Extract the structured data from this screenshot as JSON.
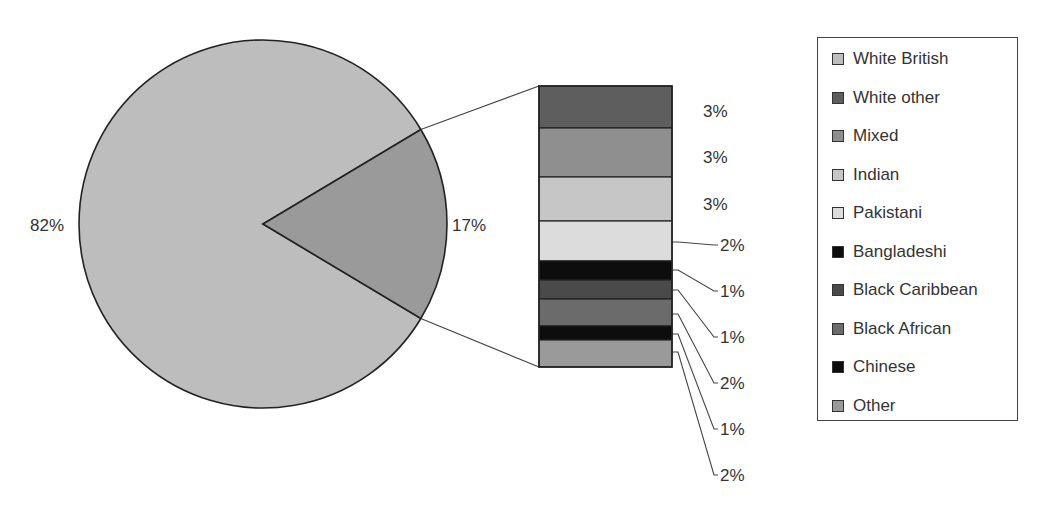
{
  "chart_data": {
    "type": "pie",
    "subtype": "bar-of-pie",
    "title": "",
    "pie": {
      "slices": [
        {
          "name": "White British",
          "value": 82,
          "label": "82%",
          "color": "#bdbdbd"
        },
        {
          "name": "All other ethnic groups",
          "value": 17,
          "label": "17%",
          "color": "#9a9a9a"
        }
      ]
    },
    "bar": {
      "segments": [
        {
          "name": "White other",
          "value": 3,
          "label": "3%",
          "color": "#5e5e5e"
        },
        {
          "name": "Mixed",
          "value": 3,
          "label": "3%",
          "color": "#8f8f8f"
        },
        {
          "name": "Indian",
          "value": 3,
          "label": "3%",
          "color": "#c6c6c6"
        },
        {
          "name": "Pakistani",
          "value": 2,
          "label": "2%",
          "color": "#dcdcdc"
        },
        {
          "name": "Bangladeshi",
          "value": 1,
          "label": "1%",
          "color": "#0d0d0d"
        },
        {
          "name": "Black Caribbean",
          "value": 1,
          "label": "1%",
          "color": "#4a4a4a"
        },
        {
          "name": "Black African",
          "value": 2,
          "label": "2%",
          "color": "#6b6b6b"
        },
        {
          "name": "Chinese",
          "value": 1,
          "label": "1%",
          "color": "#0d0d0d"
        },
        {
          "name": "Other",
          "value": 2,
          "label": "2%",
          "color": "#9a9a9a"
        }
      ]
    },
    "legend": {
      "position": "right",
      "entries": [
        {
          "label": "White British",
          "color": "#bdbdbd"
        },
        {
          "label": "White other",
          "color": "#5e5e5e"
        },
        {
          "label": "Mixed",
          "color": "#8f8f8f"
        },
        {
          "label": "Indian",
          "color": "#c6c6c6"
        },
        {
          "label": "Pakistani",
          "color": "#dcdcdc"
        },
        {
          "label": "Bangladeshi",
          "color": "#0d0d0d"
        },
        {
          "label": "Black Caribbean",
          "color": "#4a4a4a"
        },
        {
          "label": "Black African",
          "color": "#6b6b6b"
        },
        {
          "label": "Chinese",
          "color": "#0d0d0d"
        },
        {
          "label": "Other",
          "color": "#9a9a9a"
        }
      ]
    }
  }
}
